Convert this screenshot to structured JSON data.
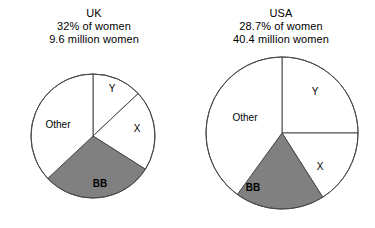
{
  "figure": {
    "background": "#ffffff",
    "line_color": "#4a4a4a",
    "shaded_color": "#808080",
    "plain_color": "#ffffff"
  },
  "chart_data": [
    {
      "type": "pie",
      "title": "UK",
      "subtitle_1": "32% of women",
      "subtitle_2": "9.6 million women",
      "xlabel": "",
      "ylabel": "",
      "legend": "none",
      "start_angle_deg": 0,
      "direction": "clockwise",
      "categories": [
        "Y",
        "X",
        "BB",
        "Other"
      ],
      "values": [
        13,
        21,
        29,
        37
      ],
      "slices": [
        {
          "label": "Y",
          "value": 13,
          "shaded": false
        },
        {
          "label": "X",
          "value": 21,
          "shaded": false
        },
        {
          "label": "BB",
          "value": 29,
          "shaded": true
        },
        {
          "label": "Other",
          "value": 37,
          "shaded": false
        }
      ]
    },
    {
      "type": "pie",
      "title": "USA",
      "subtitle_1": "28.7% of women",
      "subtitle_2": "40.4 million women",
      "xlabel": "",
      "ylabel": "",
      "legend": "none",
      "start_angle_deg": 0,
      "direction": "clockwise",
      "categories": [
        "Y",
        "X",
        "BB",
        "Other"
      ],
      "values": [
        25,
        16,
        19,
        40
      ],
      "slices": [
        {
          "label": "Y",
          "value": 25,
          "shaded": false
        },
        {
          "label": "X",
          "value": 16,
          "shaded": false
        },
        {
          "label": "BB",
          "value": 19,
          "shaded": true
        },
        {
          "label": "Other",
          "value": 40,
          "shaded": false
        }
      ]
    }
  ],
  "uk": {
    "title": "UK",
    "line1": "32% of women",
    "line2": "9.6 million women",
    "labels": {
      "y": "Y",
      "x": "X",
      "bb": "BB",
      "other": "Other"
    }
  },
  "usa": {
    "title": "USA",
    "line1": "28.7% of women",
    "line2": "40.4 million women",
    "labels": {
      "y": "Y",
      "x": "X",
      "bb": "BB",
      "other": "Other"
    }
  }
}
